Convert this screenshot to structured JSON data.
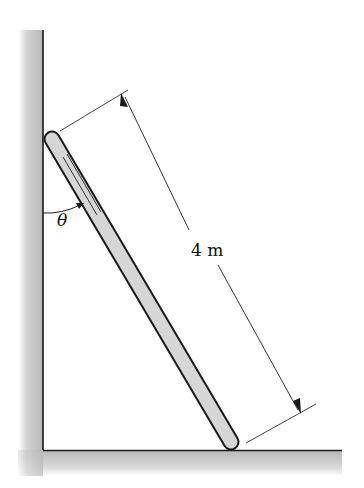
{
  "diagram": {
    "type": "statics-ladder",
    "dimension_label": "4 m",
    "angle_label": "θ",
    "elements": [
      "vertical wall",
      "horizontal floor",
      "ladder leaning against wall",
      "length dimension line",
      "angle arc between wall and ladder"
    ],
    "colors": {
      "wall_fill": "#c8c8c8",
      "ladder_fill": "#d6d6d6",
      "outline": "#1a1a1a",
      "dimension": "#333333"
    }
  }
}
